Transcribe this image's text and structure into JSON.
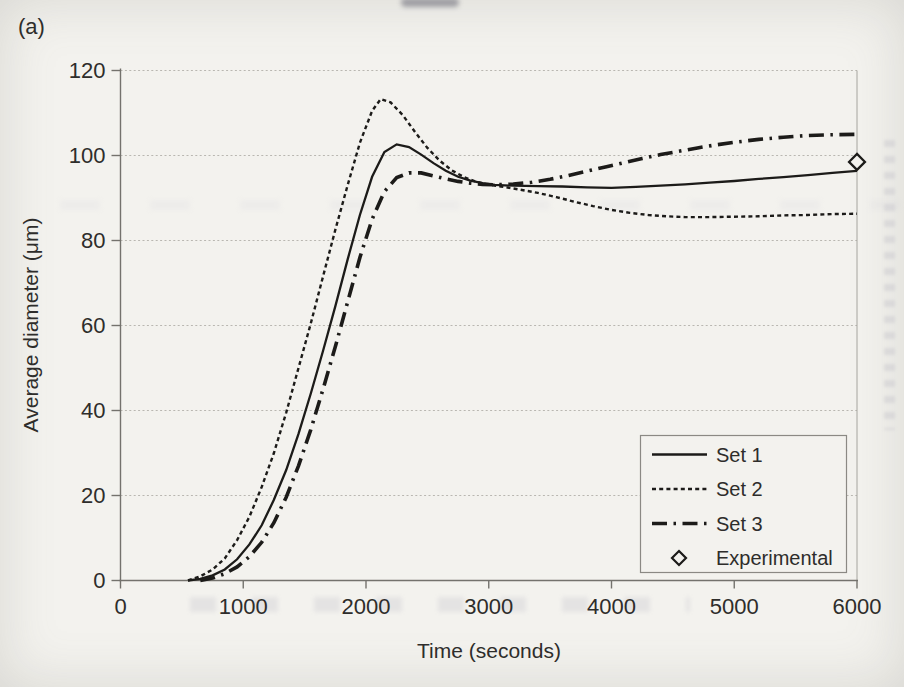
{
  "page": {
    "panel_label": "(a)"
  },
  "chart_data": {
    "type": "line",
    "title": "",
    "xlabel": "Time (seconds)",
    "ylabel": "Average diameter (μm)",
    "xlim": [
      0,
      6000
    ],
    "ylim": [
      0,
      120
    ],
    "x_ticks": [
      0,
      1000,
      2000,
      3000,
      4000,
      5000,
      6000
    ],
    "y_ticks": [
      0,
      20,
      40,
      60,
      80,
      100,
      120
    ],
    "grid": "horizontal-dotted",
    "legend_position": "bottom-right",
    "colors": {
      "line": "#1c1b19",
      "axis": "#74726d",
      "grid": "#b9b7b1",
      "text": "#2e2d2b",
      "background": "#f3f2ee"
    },
    "series": [
      {
        "name": "Set 1",
        "style": "solid",
        "points": [
          [
            550,
            0
          ],
          [
            650,
            0.4
          ],
          [
            750,
            1.2
          ],
          [
            850,
            2.6
          ],
          [
            950,
            5
          ],
          [
            1050,
            8.5
          ],
          [
            1150,
            13
          ],
          [
            1250,
            19
          ],
          [
            1350,
            26
          ],
          [
            1450,
            34.5
          ],
          [
            1550,
            44
          ],
          [
            1650,
            54
          ],
          [
            1750,
            64.5
          ],
          [
            1850,
            75.5
          ],
          [
            1950,
            86
          ],
          [
            2050,
            95
          ],
          [
            2150,
            100.8
          ],
          [
            2250,
            102.6
          ],
          [
            2350,
            102
          ],
          [
            2450,
            100.2
          ],
          [
            2550,
            98.2
          ],
          [
            2650,
            96.4
          ],
          [
            2750,
            95
          ],
          [
            2850,
            94.1
          ],
          [
            2950,
            93.5
          ],
          [
            3050,
            93.1
          ],
          [
            3200,
            92.9
          ],
          [
            3400,
            92.8
          ],
          [
            3600,
            92.7
          ],
          [
            3800,
            92.5
          ],
          [
            4000,
            92.4
          ],
          [
            4200,
            92.6
          ],
          [
            4400,
            92.9
          ],
          [
            4600,
            93.2
          ],
          [
            4800,
            93.6
          ],
          [
            5000,
            94
          ],
          [
            5200,
            94.5
          ],
          [
            5400,
            94.9
          ],
          [
            5600,
            95.4
          ],
          [
            5800,
            95.9
          ],
          [
            6000,
            96.4
          ]
        ]
      },
      {
        "name": "Set 2",
        "style": "dotted",
        "points": [
          [
            550,
            0
          ],
          [
            650,
            1
          ],
          [
            750,
            2.6
          ],
          [
            850,
            5.2
          ],
          [
            950,
            9.5
          ],
          [
            1050,
            15
          ],
          [
            1150,
            22
          ],
          [
            1250,
            30
          ],
          [
            1350,
            39.5
          ],
          [
            1450,
            50
          ],
          [
            1550,
            60.5
          ],
          [
            1650,
            71.5
          ],
          [
            1750,
            82.5
          ],
          [
            1850,
            93
          ],
          [
            1950,
            103
          ],
          [
            2050,
            110.5
          ],
          [
            2120,
            113.3
          ],
          [
            2200,
            112.5
          ],
          [
            2300,
            109.5
          ],
          [
            2400,
            105.5
          ],
          [
            2500,
            101.8
          ],
          [
            2600,
            98.8
          ],
          [
            2700,
            96.5
          ],
          [
            2800,
            94.9
          ],
          [
            2900,
            93.8
          ],
          [
            3000,
            93.1
          ],
          [
            3100,
            92.7
          ],
          [
            3250,
            92
          ],
          [
            3400,
            91.2
          ],
          [
            3550,
            90.2
          ],
          [
            3700,
            89.1
          ],
          [
            3850,
            88.1
          ],
          [
            4000,
            87.2
          ],
          [
            4150,
            86.5
          ],
          [
            4300,
            86
          ],
          [
            4450,
            85.7
          ],
          [
            4600,
            85.5
          ],
          [
            4800,
            85.5
          ],
          [
            5000,
            85.6
          ],
          [
            5200,
            85.7
          ],
          [
            5400,
            85.9
          ],
          [
            5600,
            86
          ],
          [
            5800,
            86.2
          ],
          [
            6000,
            86.3
          ]
        ]
      },
      {
        "name": "Set 3",
        "style": "dashdot",
        "points": [
          [
            650,
            0
          ],
          [
            750,
            0.6
          ],
          [
            850,
            1.6
          ],
          [
            950,
            3.2
          ],
          [
            1050,
            5.6
          ],
          [
            1150,
            9
          ],
          [
            1250,
            13.6
          ],
          [
            1350,
            19.6
          ],
          [
            1450,
            27
          ],
          [
            1550,
            35.5
          ],
          [
            1650,
            45
          ],
          [
            1750,
            55
          ],
          [
            1850,
            65.5
          ],
          [
            1950,
            76
          ],
          [
            2050,
            85
          ],
          [
            2150,
            91.5
          ],
          [
            2250,
            94.8
          ],
          [
            2350,
            95.9
          ],
          [
            2450,
            95.9
          ],
          [
            2550,
            95.2
          ],
          [
            2650,
            94.5
          ],
          [
            2750,
            93.9
          ],
          [
            2850,
            93.5
          ],
          [
            2950,
            93.2
          ],
          [
            3050,
            93.1
          ],
          [
            3200,
            93.3
          ],
          [
            3350,
            93.7
          ],
          [
            3500,
            94.4
          ],
          [
            3650,
            95.3
          ],
          [
            3800,
            96.3
          ],
          [
            3950,
            97.3
          ],
          [
            4100,
            98.3
          ],
          [
            4250,
            99.3
          ],
          [
            4400,
            100.2
          ],
          [
            4550,
            101
          ],
          [
            4700,
            101.8
          ],
          [
            4850,
            102.5
          ],
          [
            5000,
            103.1
          ],
          [
            5200,
            103.8
          ],
          [
            5400,
            104.3
          ],
          [
            5600,
            104.7
          ],
          [
            5800,
            104.9
          ],
          [
            6000,
            105
          ]
        ]
      }
    ],
    "experimental": {
      "name": "Experimental",
      "marker": "open-diamond",
      "points": [
        [
          6000,
          98.5
        ]
      ]
    }
  }
}
